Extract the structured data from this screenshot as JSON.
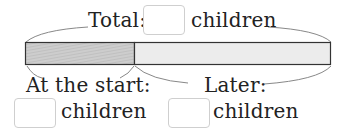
{
  "diagram": {
    "type": "bar-model",
    "total": {
      "label": "Total:",
      "unit": "children",
      "value": ""
    },
    "parts": [
      {
        "name": "start",
        "label": "At the start:",
        "unit": "children",
        "value": "",
        "fill": "#c9c9c9",
        "hatched": true
      },
      {
        "name": "later",
        "label": "Later:",
        "unit": "children",
        "value": "",
        "fill": "#ececec",
        "hatched": false
      }
    ],
    "colors": {
      "outline": "#333333",
      "brace": "#777777",
      "input_border": "#cfcfcf"
    }
  }
}
